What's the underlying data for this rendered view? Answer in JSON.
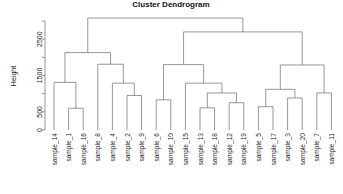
{
  "chart_data": {
    "type": "dendrogram",
    "title": "Cluster Dendrogram",
    "xlabel": "",
    "ylabel": "Height",
    "ylim": [
      0,
      3200
    ],
    "grid": false,
    "legend": "none",
    "y_ticks": [
      0,
      500,
      1000,
      1500,
      2000,
      2500,
      3000
    ],
    "y_tick_labels": [
      "0",
      "500",
      "",
      "1500",
      "",
      "2500",
      ""
    ],
    "leaf_order": [
      "sample_14",
      "sample_1",
      "sample_16",
      "sample_8",
      "sample_4",
      "sample_2",
      "sample_9",
      "sample_6",
      "sample_10",
      "sample_15",
      "sample_13",
      "sample_18",
      "sample_12",
      "sample_19",
      "sample_5",
      "sample_17",
      "sample_3",
      "sample_20",
      "sample_7",
      "sample_11"
    ],
    "merges": [
      {
        "id": "m1",
        "left": "sample_1",
        "right": "sample_16",
        "height": 600
      },
      {
        "id": "m2",
        "left": "sample_14",
        "right": "m1",
        "height": 1310
      },
      {
        "id": "m3",
        "left": "sample_2",
        "right": "sample_9",
        "height": 950
      },
      {
        "id": "m4",
        "left": "sample_4",
        "right": "m3",
        "height": 1290
      },
      {
        "id": "m5",
        "left": "sample_8",
        "right": "m4",
        "height": 1810
      },
      {
        "id": "m6",
        "left": "m2",
        "right": "m5",
        "height": 2130
      },
      {
        "id": "m7",
        "left": "sample_6",
        "right": "sample_10",
        "height": 830
      },
      {
        "id": "m8",
        "left": "sample_13",
        "right": "sample_18",
        "height": 610
      },
      {
        "id": "m9",
        "left": "sample_12",
        "right": "sample_19",
        "height": 750
      },
      {
        "id": "m10",
        "left": "m8",
        "right": "m9",
        "height": 1020
      },
      {
        "id": "m11",
        "left": "sample_15",
        "right": "m10",
        "height": 1290
      },
      {
        "id": "m12",
        "left": "m7",
        "right": "m11",
        "height": 1800
      },
      {
        "id": "m13",
        "left": "sample_5",
        "right": "sample_17",
        "height": 640
      },
      {
        "id": "m14",
        "left": "sample_3",
        "right": "sample_20",
        "height": 880
      },
      {
        "id": "m15",
        "left": "m13",
        "right": "m14",
        "height": 1120
      },
      {
        "id": "m16",
        "left": "sample_7",
        "right": "sample_11",
        "height": 1020
      },
      {
        "id": "m17",
        "left": "m15",
        "right": "m16",
        "height": 1790
      },
      {
        "id": "m18",
        "left": "m12",
        "right": "m17",
        "height": 2700
      },
      {
        "id": "m19",
        "left": "m6",
        "right": "m18",
        "height": 3080
      }
    ]
  }
}
